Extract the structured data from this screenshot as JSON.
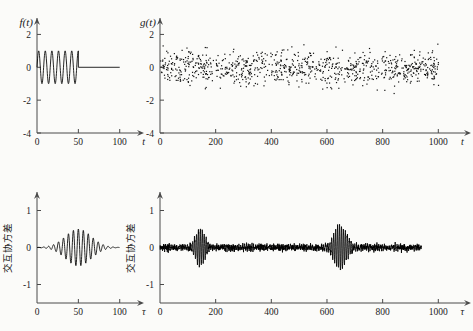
{
  "figure": {
    "background_color": "#fbfbf9",
    "ink_color": "#000000",
    "axis_color": "#4a4a4a"
  },
  "panels": {
    "top_left": {
      "name": "signal-f-panel",
      "function_label": "f(t)",
      "xlabel": "t",
      "ylabel": "",
      "xticks": [
        "0",
        "50",
        "100"
      ],
      "xtick_values": [
        0,
        50,
        100
      ],
      "yticks": [
        "2",
        "0",
        "-2",
        "-4"
      ],
      "ytick_values": [
        2,
        0,
        -2,
        -4
      ],
      "xlim": [
        0,
        110
      ],
      "ylim": [
        -4,
        3
      ]
    },
    "top_right": {
      "name": "signal-g-panel",
      "function_label": "g(t)",
      "xlabel": "t",
      "ylabel": "",
      "xticks": [
        "0",
        "200",
        "400",
        "600",
        "800",
        "1000"
      ],
      "xtick_values": [
        0,
        200,
        400,
        600,
        800,
        1000
      ],
      "yticks": [
        "2",
        "0",
        "-2",
        "-4"
      ],
      "ytick_values": [
        2,
        0,
        -2,
        -4
      ],
      "xlim": [
        0,
        1060
      ],
      "ylim": [
        -4,
        3
      ]
    },
    "bottom_left": {
      "name": "cross-covariance-short-panel",
      "function_label": "",
      "xlabel": "τ",
      "ylabel": "交互协方差",
      "xticks": [
        "0",
        "50",
        "100"
      ],
      "xtick_values": [
        0,
        50,
        100
      ],
      "yticks": [
        "1",
        "0",
        "-1"
      ],
      "ytick_values": [
        1,
        0,
        -1
      ],
      "xlim": [
        0,
        110
      ],
      "ylim": [
        -1.5,
        1.5
      ]
    },
    "bottom_right": {
      "name": "cross-covariance-long-panel",
      "function_label": "",
      "xlabel": "τ",
      "ylabel": "交互协方差",
      "xticks": [
        "0",
        "200",
        "400",
        "600",
        "800",
        "1000"
      ],
      "xtick_values": [
        0,
        200,
        400,
        600,
        800,
        1000
      ],
      "yticks": [
        "1",
        "0",
        "-1"
      ],
      "ytick_values": [
        1,
        0,
        -1
      ],
      "xlim": [
        0,
        1060
      ],
      "ylim": [
        -1.5,
        1.5
      ]
    }
  },
  "chart_data": [
    {
      "type": "line",
      "panel": "top_left",
      "title": "",
      "xlabel": "t",
      "ylabel": "f(t)",
      "xlim": [
        0,
        110
      ],
      "ylim": [
        -4,
        3
      ],
      "grid": false,
      "description": "Truncated sinusoidal burst: unit-amplitude oscillation from t=0 to t=50, then flat zero to t=100",
      "series": [
        {
          "name": "f(t)",
          "amplitude": 1.0,
          "period": 8,
          "burst_start": 0,
          "burst_end": 50,
          "flat_value": 0,
          "flat_end": 100
        }
      ]
    },
    {
      "type": "scatter",
      "panel": "top_right",
      "title": "",
      "xlabel": "t",
      "ylabel": "g(t)",
      "xlim": [
        0,
        1060
      ],
      "ylim": [
        -4,
        3
      ],
      "grid": false,
      "description": "Noisy signal: ~900 scattered points, mean 0, standard deviation about 0.5, extremes near +2.5 and -2",
      "n_points": 900,
      "mean": 0,
      "std": 0.5,
      "observed_min": -2.0,
      "observed_max": 2.5
    },
    {
      "type": "line",
      "panel": "bottom_left",
      "title": "",
      "xlabel": "τ",
      "ylabel": "交互协方差",
      "xlim": [
        0,
        110
      ],
      "ylim": [
        -1.5,
        1.5
      ],
      "grid": false,
      "description": "Gaussian-enveloped oscillating cross-covariance centred at τ=50 with peak amplitude about 0.5",
      "series": [
        {
          "name": "cross-covariance",
          "center": 50,
          "peak_amplitude": 0.5,
          "envelope_width": 22,
          "period": 6,
          "end": 100
        }
      ]
    },
    {
      "type": "line",
      "panel": "bottom_right",
      "title": "",
      "xlabel": "τ",
      "ylabel": "交互协方差",
      "xlim": [
        0,
        1060
      ],
      "ylim": [
        -1.5,
        1.5
      ],
      "grid": false,
      "description": "Noisy cross-covariance with two wave packets; first packet centred at τ≈145 peak 0.45, second larger packet at τ≈645 peak 0.6; baseline noise amplitude about 0.07",
      "noise_amplitude": 0.07,
      "trace_end": 940,
      "packets": [
        {
          "center": 145,
          "peak_amplitude": 0.45,
          "envelope_width": 26,
          "period": 7
        },
        {
          "center": 645,
          "peak_amplitude": 0.6,
          "envelope_width": 32,
          "period": 7
        }
      ]
    }
  ]
}
